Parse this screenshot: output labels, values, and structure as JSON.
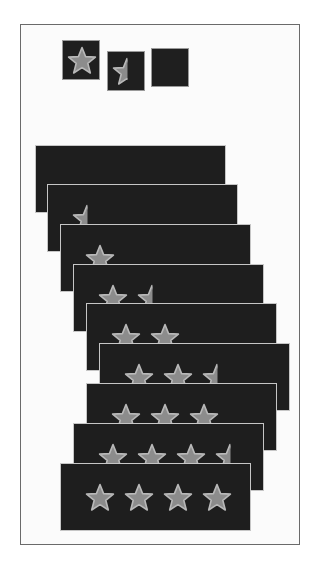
{
  "figure": {
    "colors": {
      "background": "#ffffff",
      "frame_border": "#6a6a6a",
      "tile_bg": "#1e1e1e",
      "card_border": "#c6c6c6",
      "star_fill": "#8c8c8c",
      "star_stroke": "#b8b8b8"
    },
    "small_tiles": [
      {
        "id": "full-star-tile",
        "x": 62,
        "y": 40,
        "w": 38,
        "h": 40,
        "fill": "full"
      },
      {
        "id": "half-star-tile",
        "x": 107,
        "y": 51,
        "w": 38,
        "h": 40,
        "fill": "half"
      },
      {
        "id": "empty-star-tile",
        "x": 151,
        "y": 48,
        "w": 38,
        "h": 39,
        "fill": "empty"
      }
    ],
    "rating_cards": [
      {
        "rating": 0.0,
        "x": 35,
        "y": 145
      },
      {
        "rating": 0.5,
        "x": 47,
        "y": 184
      },
      {
        "rating": 1.0,
        "x": 60,
        "y": 224
      },
      {
        "rating": 1.5,
        "x": 73,
        "y": 264
      },
      {
        "rating": 2.0,
        "x": 86,
        "y": 303
      },
      {
        "rating": 2.5,
        "x": 99,
        "y": 343
      },
      {
        "rating": 3.0,
        "x": 86,
        "y": 383
      },
      {
        "rating": 3.5,
        "x": 73,
        "y": 423
      },
      {
        "rating": 4.0,
        "x": 60,
        "y": 463
      }
    ],
    "card_star_layout": {
      "first_star_offset_x": 24,
      "star_spacing_x": 39,
      "star_offset_y": 19,
      "max_stars": 4
    }
  }
}
